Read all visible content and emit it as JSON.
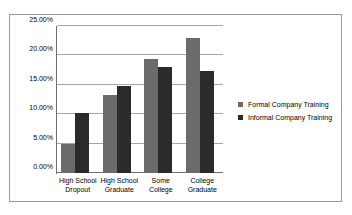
{
  "chart_data": {
    "type": "bar",
    "title": "",
    "xlabel": "",
    "ylabel": "",
    "ylim": [
      0,
      25
    ],
    "ytick_labels": [
      "0.00%",
      "5.00%",
      "10.00%",
      "15.00%",
      "20.00%",
      "25.00%"
    ],
    "ytick_values": [
      0,
      5,
      10,
      15,
      20,
      25
    ],
    "grid": true,
    "legend_position": "right",
    "categories": [
      "High School Dropout",
      "High School Graduate",
      "Some College",
      "College Graduate"
    ],
    "category_lines": [
      [
        "High School",
        "Dropout"
      ],
      [
        "High School",
        "Graduate"
      ],
      [
        "Some",
        "College"
      ],
      [
        "College",
        "Graduate"
      ]
    ],
    "series": [
      {
        "name": "Formal Company Training",
        "color": "#6b6b6b",
        "values": [
          5.0,
          13.2,
          19.4,
          23.0
        ]
      },
      {
        "name": "Informal Company Training",
        "color": "#2b2b2b",
        "values": [
          10.2,
          14.8,
          18.1,
          17.3
        ]
      }
    ]
  },
  "frame": {
    "border_color": "#9a9a9a",
    "background": "#ffffff"
  }
}
